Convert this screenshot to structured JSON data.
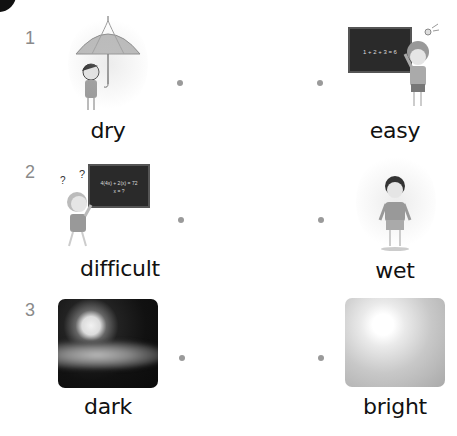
{
  "worksheet": {
    "rows": [
      {
        "number": "1",
        "left": {
          "label": "dry",
          "image": "girl-with-umbrella-in-rain"
        },
        "right": {
          "label": "easy",
          "image": "boy-at-chalkboard-with-lightbulb",
          "board_text": "1 + 2 + 3 = 6"
        }
      },
      {
        "number": "2",
        "left": {
          "label": "difficult",
          "image": "confused-girl-at-chalkboard",
          "board_text_line1": "4(4x) + 2(x) = 72",
          "board_text_line2": "x = ?",
          "marks": "? ?"
        },
        "right": {
          "label": "wet",
          "image": "boy-standing-in-rain"
        }
      },
      {
        "number": "3",
        "left": {
          "label": "dark",
          "image": "moon-night-clouds"
        },
        "right": {
          "label": "bright",
          "image": "bright-sunlight"
        }
      }
    ],
    "colors": {
      "text": "#111111",
      "number": "#8a8a8a",
      "dot": "#9a9a9a",
      "board": "#2a2a2a"
    }
  }
}
